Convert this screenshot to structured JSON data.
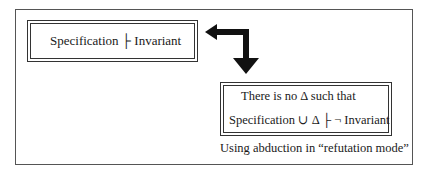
{
  "diagram": {
    "left_box": {
      "text": "Specification ├ Invariant"
    },
    "right_box": {
      "line1": "There is no Δ such that",
      "line2": "Specification ∪ Δ ├  ¬ Invariant"
    },
    "caption": "Using abduction in “refutation mode”",
    "arrow": "bent-double-arrow-icon"
  }
}
